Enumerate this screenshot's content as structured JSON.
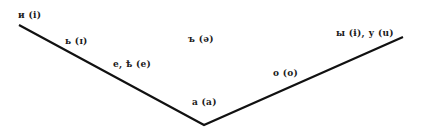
{
  "diagram": {
    "type": "vowel-height-chart",
    "line_color": "#111111",
    "polyline": [
      [
        19,
        25
      ],
      [
        204,
        125
      ],
      [
        403,
        37
      ]
    ],
    "labels": [
      {
        "id": "i",
        "text": "и (i)",
        "x": 18,
        "y": 11
      },
      {
        "id": "soft-sign",
        "text": "ь (ɪ)",
        "x": 65,
        "y": 37
      },
      {
        "id": "e-yat",
        "text": "е, ѣ (е)",
        "x": 113,
        "y": 60
      },
      {
        "id": "hard-sign",
        "text": "ъ (ə)",
        "x": 188,
        "y": 35
      },
      {
        "id": "a",
        "text": "а (а)",
        "x": 192,
        "y": 98
      },
      {
        "id": "o",
        "text": "о (о)",
        "x": 273,
        "y": 69
      },
      {
        "id": "y-u",
        "text": "ы (ɨ), у (u)",
        "x": 336,
        "y": 29
      }
    ]
  }
}
